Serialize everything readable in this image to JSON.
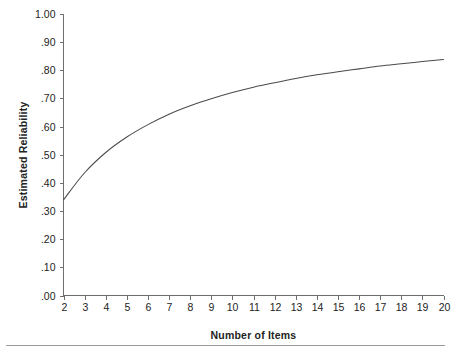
{
  "figure": {
    "background_color": "#ffffff",
    "line_color": "#4a4a4a",
    "axis_color": "#6e6e6e",
    "rule_color": "#9a9a9a"
  },
  "chart_data": {
    "type": "line",
    "title": "",
    "subtitle": "",
    "xlabel": "Number of Items",
    "ylabel": "Estimated Reliability",
    "x": [
      2,
      3,
      4,
      5,
      6,
      7,
      8,
      9,
      10,
      11,
      12,
      13,
      14,
      15,
      16,
      17,
      18,
      19,
      20
    ],
    "values": [
      0.34,
      0.436,
      0.508,
      0.563,
      0.607,
      0.644,
      0.674,
      0.699,
      0.721,
      0.74,
      0.756,
      0.771,
      0.784,
      0.795,
      0.805,
      0.815,
      0.823,
      0.831,
      0.838
    ],
    "series": [
      {
        "name": "Estimated Reliability",
        "values": [
          0.34,
          0.436,
          0.508,
          0.563,
          0.607,
          0.644,
          0.674,
          0.699,
          0.721,
          0.74,
          0.756,
          0.771,
          0.784,
          0.795,
          0.805,
          0.815,
          0.823,
          0.831,
          0.838
        ]
      }
    ],
    "x_tick_labels": [
      "2",
      "3",
      "4",
      "5",
      "6",
      "7",
      "8",
      "9",
      "10",
      "11",
      "12",
      "13",
      "14",
      "15",
      "16",
      "17",
      "18",
      "19",
      "20"
    ],
    "y_tick_labels": [
      "1.00",
      ".90",
      ".80",
      ".70",
      ".60",
      ".50",
      ".40",
      ".30",
      ".20",
      ".10",
      ".00"
    ],
    "y_tick_values": [
      1.0,
      0.9,
      0.8,
      0.7,
      0.6,
      0.5,
      0.4,
      0.3,
      0.2,
      0.1,
      0.0
    ],
    "xlim": [
      2,
      20
    ],
    "ylim": [
      0.0,
      1.0
    ],
    "grid": false,
    "legend": false,
    "legend_position": "none"
  }
}
